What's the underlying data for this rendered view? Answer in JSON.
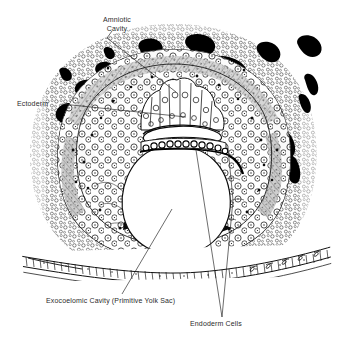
{
  "figure": {
    "type": "histological-illustration",
    "background_color": "#ffffff",
    "ink_color": "#000000",
    "label_color": "#2b2b2b"
  },
  "labels": [
    {
      "id": "amniotic-cavity",
      "lines": [
        "Amniotic",
        "Cavity"
      ],
      "line1": "Amniotic",
      "line2": "Cavity",
      "text_x": 117,
      "text_y": 22,
      "anchor": "middle",
      "leader": "M 112 31 L 107 38 L 176 92"
    },
    {
      "id": "ectoderm",
      "lines": [
        "Ectoderm"
      ],
      "line1": "Ectoderm",
      "text_x": 17,
      "text_y": 106,
      "anchor": "start",
      "leader": "M 62 104 L 186 117"
    },
    {
      "id": "exocoelomic-cavity",
      "lines": [
        "Exocoelomic Cavity (Primitive Yolk Sac)"
      ],
      "line1": "Exocoelomic Cavity (Primitive Yolk Sac)",
      "text_x": 46,
      "text_y": 303,
      "anchor": "start",
      "leader": "M 122 294 L 172 209"
    },
    {
      "id": "endoderm-cells",
      "lines": [
        "Endoderm Cells"
      ],
      "line1": "Endoderm Cells",
      "text_x": 190,
      "text_y": 326,
      "anchor": "start",
      "leader_a": "M 222 317 L 196 150",
      "leader_b": "M 222 317 L 233 200 L 228 148"
    }
  ],
  "structures": [
    {
      "name": "syncytiotrophoblast-stipple-zone",
      "description": "outer stippled cellular zone"
    },
    {
      "name": "trophoblastic-lacunae",
      "description": "solid black blood-filled spaces"
    },
    {
      "name": "cytotrophoblast-ring",
      "description": "gray hatched inner ring"
    },
    {
      "name": "exocoelomic-cavity",
      "description": "central white oval cavity"
    },
    {
      "name": "ectoderm-epiblast",
      "description": "columnar cell cluster at top"
    },
    {
      "name": "amniotic-cavity",
      "description": "crescent slit beneath ectoderm"
    },
    {
      "name": "endoderm-cell-row",
      "description": "beaded cell row lining yolk sac roof"
    },
    {
      "name": "uterine-epithelium",
      "description": "horizontal band across lower figure"
    }
  ]
}
